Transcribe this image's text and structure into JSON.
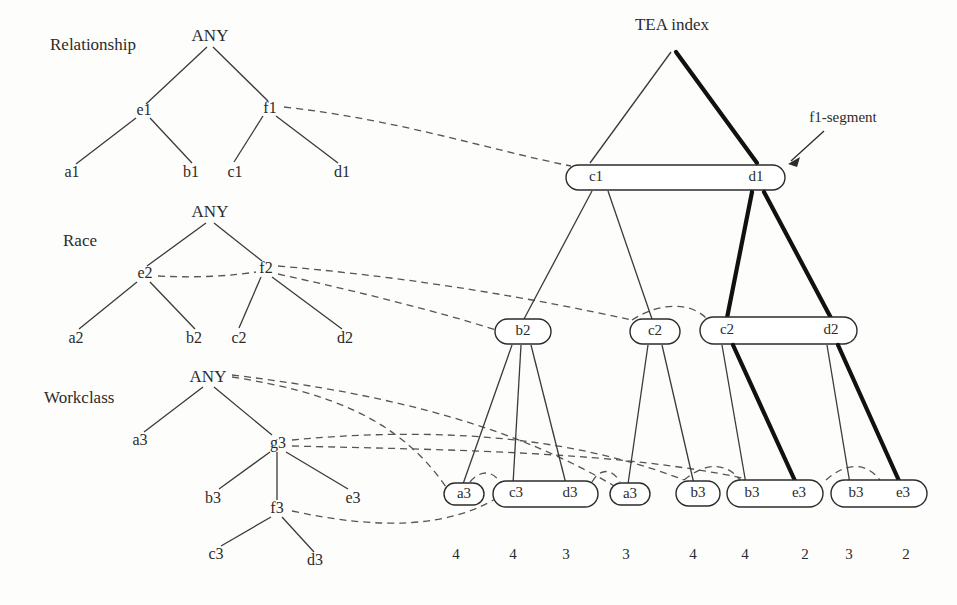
{
  "figure": {
    "index_title": "TEA index",
    "annotation": "f1-segment"
  },
  "trees": [
    {
      "title": "Relationship",
      "root": "ANY",
      "nodes": [
        "e1",
        "f1",
        "a1",
        "b1",
        "c1",
        "d1"
      ],
      "labels": {
        "root": "ANY",
        "mid_left": "e1",
        "mid_right": "f1",
        "leaf_1": "a1",
        "leaf_2": "b1",
        "leaf_3": "c1",
        "leaf_4": "d1"
      }
    },
    {
      "title": "Race",
      "root": "ANY",
      "nodes": [
        "e2",
        "f2",
        "a2",
        "b2",
        "c2",
        "d2"
      ],
      "labels": {
        "root": "ANY",
        "mid_left": "e2",
        "mid_right": "f2",
        "leaf_1": "a2",
        "leaf_2": "b2",
        "leaf_3": "c2",
        "leaf_4": "d2"
      }
    },
    {
      "title": "Workclass",
      "root": "ANY",
      "nodes": [
        "a3",
        "g3",
        "b3",
        "f3",
        "e3",
        "c3",
        "d3"
      ],
      "labels": {
        "root": "ANY",
        "child_1": "a3",
        "child_2": "g3",
        "g_child_1": "b3",
        "g_child_2": "f3",
        "g_child_3": "e3",
        "f_child_1": "c3",
        "f_child_2": "d3"
      }
    }
  ],
  "index": {
    "level1": [
      {
        "id": "seg-l1-1",
        "cells": [
          "c1",
          "d1"
        ]
      }
    ],
    "level2": [
      {
        "id": "seg-l2-1",
        "cells": [
          "b2"
        ]
      },
      {
        "id": "seg-l2-2",
        "cells": [
          "c2"
        ]
      },
      {
        "id": "seg-l2-3",
        "cells": [
          "c2",
          "d2"
        ]
      }
    ],
    "level3": [
      {
        "id": "seg-l3-1",
        "cells": [
          "a3"
        ]
      },
      {
        "id": "seg-l3-2",
        "cells": [
          "c3",
          "d3"
        ]
      },
      {
        "id": "seg-l3-3",
        "cells": [
          "a3"
        ]
      },
      {
        "id": "seg-l3-4",
        "cells": [
          "b3"
        ]
      },
      {
        "id": "seg-l3-5",
        "cells": [
          "b3",
          "e3"
        ]
      },
      {
        "id": "seg-l3-6",
        "cells": [
          "b3",
          "e3"
        ]
      }
    ],
    "counts": [
      "4",
      "4",
      "3",
      "3",
      "4",
      "4",
      "2",
      "3",
      "2"
    ]
  },
  "colors": {
    "ink": "#2b2b2b",
    "thick_edge": "#111111",
    "dashed_edge": "#555555",
    "background": "#fdfdfc"
  }
}
